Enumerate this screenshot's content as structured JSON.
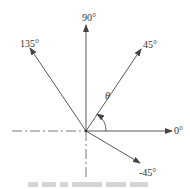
{
  "diagram": {
    "center": {
      "x": 86,
      "y": 131
    },
    "axes": [
      {
        "angle": "0°",
        "label": "0°"
      },
      {
        "angle": "45°",
        "label": "45°"
      },
      {
        "angle": "90°",
        "label": "90°"
      },
      {
        "angle": "135°",
        "label": "135°"
      },
      {
        "angle": "-45°",
        "label": "-45°"
      }
    ],
    "angle_symbol": "θ",
    "labels": {
      "deg0": "0°",
      "deg45": "45°",
      "deg90": "90°",
      "deg135": "135°",
      "degm45": "-45°",
      "theta": "θ"
    },
    "colors": {
      "line": "#444444",
      "text": "#333333"
    }
  }
}
